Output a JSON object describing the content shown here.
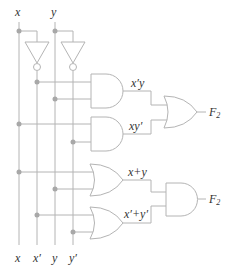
{
  "diagram": {
    "title": "",
    "colors": {
      "wire": "#b4b4b4",
      "junction": "#a8a8a8",
      "text": "#333333"
    },
    "top_labels": {
      "x": "x",
      "y": "y"
    },
    "bottom_labels": {
      "x": "x",
      "x_prime": "x′",
      "y": "y",
      "y_prime": "y′"
    },
    "gates": {
      "not1": {
        "type": "NOT",
        "input": "x",
        "output": "x′"
      },
      "not2": {
        "type": "NOT",
        "input": "y",
        "output": "y′"
      },
      "and1": {
        "type": "AND",
        "inputs": [
          "x′",
          "y"
        ],
        "output_label": "x′y"
      },
      "and2": {
        "type": "AND",
        "inputs": [
          "x",
          "y′"
        ],
        "output_label": "xy′"
      },
      "or_top": {
        "type": "OR",
        "inputs": [
          "x′y",
          "xy′"
        ],
        "output": "F2"
      },
      "or1": {
        "type": "OR",
        "inputs": [
          "x",
          "y"
        ],
        "output_label": "x+y"
      },
      "or2": {
        "type": "OR",
        "inputs": [
          "x′",
          "y′"
        ],
        "output_label": "x′+y′"
      },
      "and_bottom": {
        "type": "AND",
        "inputs": [
          "x+y",
          "x′+y′"
        ],
        "output": "F2"
      }
    },
    "output_labels": {
      "top": {
        "main": "F",
        "sub": "2"
      },
      "bottom": {
        "main": "F",
        "sub": "2"
      }
    }
  }
}
